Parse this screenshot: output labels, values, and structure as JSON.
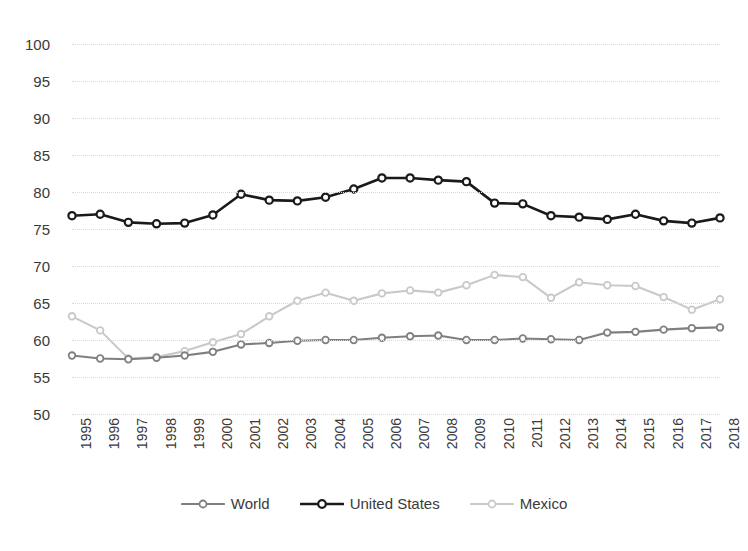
{
  "chart_data": {
    "type": "line",
    "title": "",
    "xlabel": "",
    "ylabel": "",
    "ylim": [
      50,
      100
    ],
    "ytick_step": 5,
    "grid": true,
    "legend_position": "bottom",
    "categories": [
      "1995",
      "1996",
      "1997",
      "1998",
      "1999",
      "2000",
      "2001",
      "2002",
      "2003",
      "2004",
      "2005",
      "2006",
      "2007",
      "2008",
      "2009",
      "2010",
      "2011",
      "2012",
      "2013",
      "2014",
      "2015",
      "2016",
      "2017",
      "2018"
    ],
    "yticks": [
      "50",
      "55",
      "60",
      "65",
      "70",
      "75",
      "80",
      "85",
      "90",
      "95",
      "100"
    ],
    "series": [
      {
        "name": "World",
        "color": "#7f7f7f",
        "values": [
          57.9,
          57.5,
          57.4,
          57.6,
          57.9,
          58.4,
          59.4,
          59.6,
          59.9,
          60.0,
          60.0,
          60.3,
          60.5,
          60.6,
          60.0,
          60.0,
          60.2,
          60.1,
          60.0,
          61.0,
          61.1,
          61.4,
          61.6,
          61.7
        ]
      },
      {
        "name": "United States",
        "color": "#1a1a1a",
        "values": [
          76.8,
          77.0,
          75.9,
          75.7,
          75.8,
          76.9,
          79.7,
          78.9,
          78.8,
          79.3,
          80.4,
          81.9,
          81.9,
          81.6,
          81.4,
          78.5,
          78.4,
          76.8,
          76.6,
          76.3,
          77.0,
          76.1,
          75.8,
          76.5
        ]
      },
      {
        "name": "Mexico",
        "color": "#c9c9c9",
        "values": [
          63.2,
          61.3,
          57.5,
          57.7,
          58.5,
          59.7,
          60.8,
          63.2,
          65.3,
          66.4,
          65.3,
          66.3,
          66.7,
          66.4,
          67.4,
          68.8,
          68.5,
          65.7,
          67.8,
          67.4,
          67.3,
          65.8,
          64.1,
          65.5
        ]
      }
    ]
  }
}
